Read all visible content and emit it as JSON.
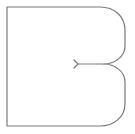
{
  "figure": {
    "stroke_color": "#7a7a7a",
    "background_color": "#ffffff",
    "stroke_width": 1.2
  },
  "shape": {
    "outline_path": "M 7 7 L 100 7 C 114 7 125 16 125 30 L 125 46 C 125 57 114 64 104 64 C 114 64 125 71 125 82 L 125 104 C 125 117 114 126 100 126 L 7 126 Z",
    "notch_path": "M 104 64 L 78 64 M 78 64 L 74 60 M 78 64 L 74 68"
  }
}
